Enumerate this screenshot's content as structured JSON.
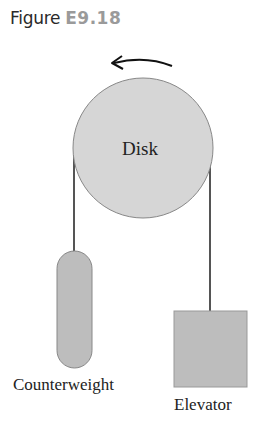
{
  "figure": {
    "prefix": "Figure",
    "number": "E9.18"
  },
  "diagram": {
    "disk_label": "Disk",
    "counterweight_label": "Counterweight",
    "elevator_label": "Elevator",
    "rotation_direction": "counterclockwise",
    "colors": {
      "disk_fill": "#d6d6d6",
      "mass_fill": "#bdbdbd",
      "rope": "#555555",
      "arrow": "#111111"
    }
  }
}
